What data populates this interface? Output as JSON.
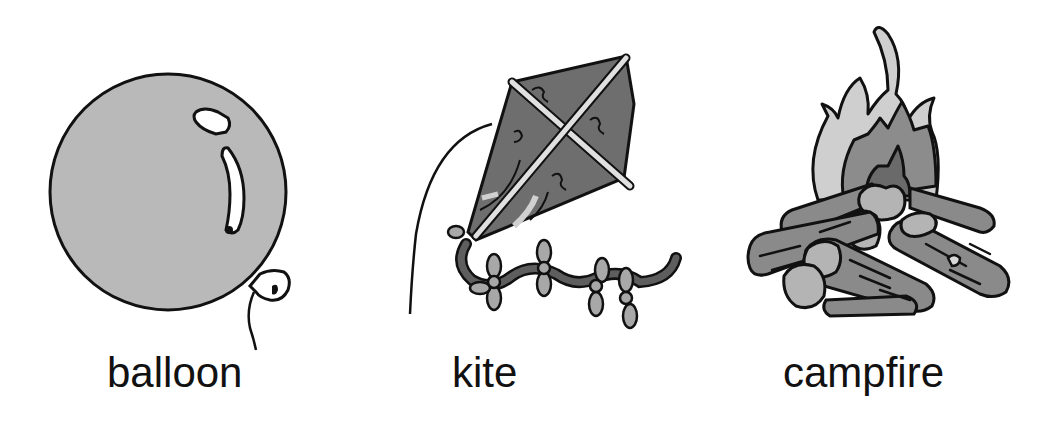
{
  "items": [
    {
      "id": "balloon",
      "label": "balloon",
      "icon": "balloon-illustration"
    },
    {
      "id": "kite",
      "label": "kite",
      "icon": "kite-illustration"
    },
    {
      "id": "campfire",
      "label": "campfire",
      "icon": "campfire-illustration"
    }
  ],
  "colors": {
    "background": "#ffffff",
    "outline": "#111111",
    "balloon_fill": "#b9b9b9",
    "kite_fill": "#6e6e6e",
    "kite_tail_dark": "#5e5e5e",
    "kite_bow": "#a8a8a8",
    "flame_outer": "#cfcfcf",
    "flame_mid": "#8c8c8c",
    "flame_inner": "#6a6a6a",
    "log": "#8a8a8a",
    "log_end": "#b4b4b4"
  }
}
